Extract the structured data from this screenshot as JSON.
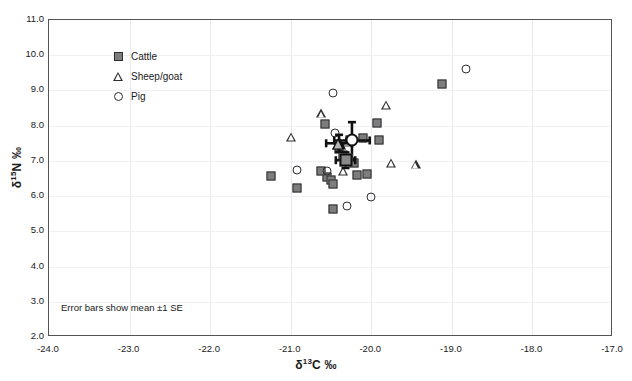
{
  "chart_data": {
    "type": "scatter",
    "title": "",
    "xlabel": "δ 13C ‰",
    "ylabel": "δ 15N ‰",
    "xlabel_parts": {
      "symbol": "δ",
      "sup": "13",
      "rest": "C ‰"
    },
    "ylabel_parts": {
      "symbol": "δ",
      "sup": "15",
      "rest": "N ‰"
    },
    "xlim": [
      -24.0,
      -17.0
    ],
    "ylim": [
      2.0,
      11.0
    ],
    "xticks": [
      "-24.0",
      "-23.0",
      "-22.0",
      "-21.0",
      "-20.0",
      "-19.0",
      "-18.0",
      "-17.0"
    ],
    "xtick_values": [
      -24.0,
      -23.0,
      -22.0,
      -21.0,
      -20.0,
      -19.0,
      -18.0,
      -17.0
    ],
    "yticks": [
      "11.0",
      "10.0",
      "9.0",
      "8.0",
      "7.0",
      "6.0",
      "5.0",
      "4.0",
      "3.0",
      "2.0"
    ],
    "ytick_values": [
      11.0,
      10.0,
      9.0,
      8.0,
      7.0,
      6.0,
      5.0,
      4.0,
      3.0,
      2.0
    ],
    "grid": true,
    "legend_position": "top-left",
    "annotation": "Error bars show mean ±1 SE",
    "colors": {
      "cattle_fill": "#7d7d7d",
      "marker_stroke": "#2e2e2e",
      "gridline": "#e9e9ef",
      "frame": "#555555",
      "errorbar": "#111111"
    },
    "series": [
      {
        "name": "Cattle",
        "marker": "square-filled",
        "points": [
          [
            -21.25,
            6.58
          ],
          [
            -20.92,
            6.23
          ],
          [
            -20.58,
            8.06
          ],
          [
            -20.55,
            6.55
          ],
          [
            -20.5,
            6.45
          ],
          [
            -20.48,
            6.34
          ],
          [
            -20.47,
            5.63
          ],
          [
            -20.4,
            7.35
          ],
          [
            -20.35,
            7.18
          ],
          [
            -20.3,
            7.02
          ],
          [
            -20.27,
            7.6
          ],
          [
            -20.22,
            6.95
          ],
          [
            -20.18,
            6.6
          ],
          [
            -20.1,
            7.65
          ],
          [
            -20.05,
            6.62
          ],
          [
            -19.93,
            8.08
          ],
          [
            -19.9,
            7.58
          ],
          [
            -19.12,
            9.18
          ],
          [
            -20.62,
            6.7
          ]
        ]
      },
      {
        "name": "Sheep/goat",
        "marker": "triangle-open",
        "points": [
          [
            -21.0,
            7.68
          ],
          [
            -20.62,
            8.35
          ],
          [
            -20.42,
            7.45
          ],
          [
            -20.35,
            6.72
          ],
          [
            -20.3,
            7.55
          ],
          [
            -19.82,
            8.6
          ],
          [
            -19.75,
            6.95
          ],
          [
            -19.45,
            6.9
          ]
        ]
      },
      {
        "name": "Pig",
        "marker": "circle-open",
        "points": [
          [
            -20.92,
            6.73
          ],
          [
            -20.55,
            6.7
          ],
          [
            -20.48,
            8.92
          ],
          [
            -20.45,
            7.78
          ],
          [
            -20.3,
            5.73
          ],
          [
            -20.28,
            7.6
          ],
          [
            -20.0,
            5.98
          ],
          [
            -18.82,
            9.62
          ]
        ]
      }
    ],
    "means": [
      {
        "name": "Cattle",
        "marker": "square-filled",
        "x": -20.32,
        "y": 7.02,
        "xerr": 0.12,
        "yerr": 0.22
      },
      {
        "name": "Sheep/goat",
        "marker": "triangle-open",
        "x": -20.4,
        "y": 7.5,
        "xerr": 0.16,
        "yerr": 0.24
      },
      {
        "name": "Pig",
        "marker": "circle-open",
        "x": -20.24,
        "y": 7.58,
        "xerr": 0.22,
        "yerr": 0.52
      }
    ]
  },
  "legend": {
    "items": [
      {
        "label": "Cattle",
        "marker": "square-filled"
      },
      {
        "label": "Sheep/goat",
        "marker": "triangle-open"
      },
      {
        "label": "Pig",
        "marker": "circle-open"
      }
    ]
  }
}
